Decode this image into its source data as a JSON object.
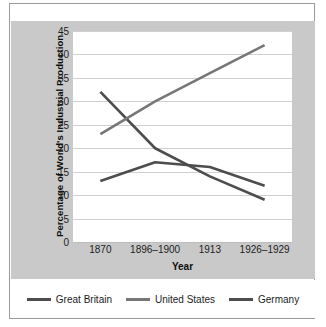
{
  "chart_data": {
    "type": "line",
    "title": "",
    "xlabel": "Year",
    "ylabel": "Percentage of World's Industrial Production",
    "categories": [
      "1870",
      "1896–1900",
      "1913",
      "1926–1929"
    ],
    "ylim": [
      0,
      45
    ],
    "yticks": [
      0,
      5,
      10,
      15,
      20,
      25,
      30,
      35,
      40,
      45
    ],
    "grid": true,
    "legend_position": "bottom",
    "series": [
      {
        "name": "Great Britain",
        "color": "#4d4d4d",
        "values": [
          32,
          20,
          14,
          9
        ]
      },
      {
        "name": "United States",
        "color": "#777777",
        "values": [
          23,
          30,
          36,
          42
        ]
      },
      {
        "name": "Germany",
        "color": "#4d4d4d",
        "values": [
          13,
          17,
          16,
          12
        ]
      }
    ]
  },
  "colors": {
    "panel_background": "#c9c9c9",
    "plot_background": "#ffffff",
    "gridline": "#d0d0d0",
    "frame_border": "#9b9b9b",
    "text": "#1d1d1d"
  }
}
